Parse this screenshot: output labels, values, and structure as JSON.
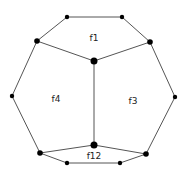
{
  "diagram": {
    "type": "planar-graph",
    "nodes": [
      {
        "id": "n1",
        "size": "small"
      },
      {
        "id": "n2",
        "size": "small"
      },
      {
        "id": "n3",
        "size": "medium"
      },
      {
        "id": "n4",
        "size": "medium"
      },
      {
        "id": "n5",
        "size": "large"
      },
      {
        "id": "n6",
        "size": "small"
      },
      {
        "id": "n7",
        "size": "small"
      },
      {
        "id": "n8",
        "size": "large"
      },
      {
        "id": "n9",
        "size": "medium"
      },
      {
        "id": "n10",
        "size": "medium"
      },
      {
        "id": "n11",
        "size": "small"
      },
      {
        "id": "n12",
        "size": "small"
      }
    ],
    "edges": [
      [
        "n1",
        "n2"
      ],
      [
        "n1",
        "n3"
      ],
      [
        "n2",
        "n4"
      ],
      [
        "n3",
        "n5"
      ],
      [
        "n4",
        "n5"
      ],
      [
        "n3",
        "n6"
      ],
      [
        "n4",
        "n7"
      ],
      [
        "n5",
        "n8"
      ],
      [
        "n6",
        "n9"
      ],
      [
        "n7",
        "n10"
      ],
      [
        "n8",
        "n9"
      ],
      [
        "n8",
        "n10"
      ],
      [
        "n9",
        "n11"
      ],
      [
        "n10",
        "n12"
      ],
      [
        "n11",
        "n12"
      ]
    ],
    "faces": [
      {
        "id": "f1",
        "label": "f1"
      },
      {
        "id": "f4",
        "label": "f4"
      },
      {
        "id": "f3",
        "label": "f3"
      },
      {
        "id": "f12",
        "label": "f12"
      }
    ]
  }
}
